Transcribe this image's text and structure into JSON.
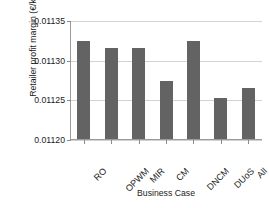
{
  "chart_data": {
    "type": "bar",
    "title": "",
    "xlabel": "Business Case",
    "ylabel": "Retailer profit margin (€/kWh)",
    "categories": [
      "RO",
      "OPWM",
      "MIR",
      "CM",
      "DNCM",
      "DUoS",
      "All"
    ],
    "values": [
      0.011324,
      0.011315,
      0.011315,
      0.011273,
      0.011324,
      0.011252,
      0.011264
    ],
    "ylim": [
      0.0112,
      0.01135
    ],
    "yticks": [
      0.0112,
      0.01125,
      0.0113,
      0.01135
    ],
    "ytick_labels": [
      "0.01120",
      "0.01125",
      "0.01130",
      "0.01135"
    ],
    "grid": true,
    "legend": null,
    "bar_color": "#636363",
    "grid_color": "#d2d2d2",
    "axis_color": "#9a9a9a"
  }
}
